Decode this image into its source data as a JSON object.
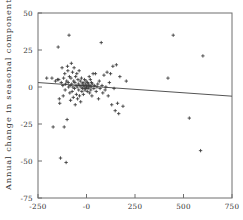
{
  "chart_data": {
    "type": "scatter",
    "title": "",
    "xlabel": "",
    "ylabel": "Annual change in seasonal component",
    "xlim": [
      -250,
      750
    ],
    "ylim": [
      -75,
      50
    ],
    "xticks": [
      -250,
      0,
      250,
      500,
      750
    ],
    "xticklabels": [
      "-250",
      "-0",
      "250",
      "500",
      "750"
    ],
    "yticks": [
      50,
      25,
      0,
      -25,
      -50,
      -75
    ],
    "yticklabels": [
      "50",
      "25",
      "0",
      "-25",
      "-50",
      "-75"
    ],
    "grid": false,
    "legend": null,
    "marker": "plus",
    "marker_color": "#3a3a3a",
    "frame_color": "#6e6e6e",
    "background": "#ffffff",
    "trendline": {
      "type": "line",
      "color": "#555555",
      "x": [
        -250,
        750
      ],
      "y": [
        3.0,
        -6.2
      ]
    },
    "points": [
      {
        "x": -205,
        "y": 6
      },
      {
        "x": -178,
        "y": 6
      },
      {
        "x": -172,
        "y": -27
      },
      {
        "x": -160,
        "y": 4
      },
      {
        "x": -150,
        "y": 5
      },
      {
        "x": -146,
        "y": 27
      },
      {
        "x": -143,
        "y": 5
      },
      {
        "x": -140,
        "y": -8
      },
      {
        "x": -138,
        "y": -11
      },
      {
        "x": -134,
        "y": -48
      },
      {
        "x": -130,
        "y": 3
      },
      {
        "x": -126,
        "y": 13
      },
      {
        "x": -122,
        "y": 1
      },
      {
        "x": -120,
        "y": -6
      },
      {
        "x": -118,
        "y": 6
      },
      {
        "x": -115,
        "y": -27
      },
      {
        "x": -112,
        "y": 9
      },
      {
        "x": -110,
        "y": -2
      },
      {
        "x": -108,
        "y": 2
      },
      {
        "x": -105,
        "y": -51
      },
      {
        "x": -102,
        "y": 4
      },
      {
        "x": -100,
        "y": -22
      },
      {
        "x": -98,
        "y": 14
      },
      {
        "x": -96,
        "y": 11
      },
      {
        "x": -94,
        "y": 3
      },
      {
        "x": -92,
        "y": 0
      },
      {
        "x": -90,
        "y": 35
      },
      {
        "x": -88,
        "y": 7
      },
      {
        "x": -86,
        "y": -4
      },
      {
        "x": -84,
        "y": 1
      },
      {
        "x": -82,
        "y": -9
      },
      {
        "x": -80,
        "y": 6
      },
      {
        "x": -78,
        "y": 16
      },
      {
        "x": -76,
        "y": 2
      },
      {
        "x": -74,
        "y": -3
      },
      {
        "x": -72,
        "y": 10
      },
      {
        "x": -70,
        "y": 0
      },
      {
        "x": -68,
        "y": -7
      },
      {
        "x": -66,
        "y": 4
      },
      {
        "x": -64,
        "y": 13
      },
      {
        "x": -62,
        "y": -1
      },
      {
        "x": -60,
        "y": 3
      },
      {
        "x": -58,
        "y": -12
      },
      {
        "x": -56,
        "y": 7
      },
      {
        "x": -54,
        "y": 1
      },
      {
        "x": -52,
        "y": -5
      },
      {
        "x": -50,
        "y": 9
      },
      {
        "x": -48,
        "y": 0
      },
      {
        "x": -46,
        "y": -8
      },
      {
        "x": -44,
        "y": 5
      },
      {
        "x": -42,
        "y": 2
      },
      {
        "x": -40,
        "y": -2
      },
      {
        "x": -38,
        "y": 11
      },
      {
        "x": -36,
        "y": -6
      },
      {
        "x": -34,
        "y": 1
      },
      {
        "x": -32,
        "y": 4
      },
      {
        "x": -30,
        "y": -10
      },
      {
        "x": -28,
        "y": 0
      },
      {
        "x": -26,
        "y": 6
      },
      {
        "x": -24,
        "y": -3
      },
      {
        "x": -22,
        "y": 2
      },
      {
        "x": -20,
        "y": -1
      },
      {
        "x": -18,
        "y": 3
      },
      {
        "x": -16,
        "y": -5
      },
      {
        "x": -14,
        "y": 1
      },
      {
        "x": -12,
        "y": 0
      },
      {
        "x": -10,
        "y": 5
      },
      {
        "x": -8,
        "y": -2
      },
      {
        "x": -6,
        "y": 2
      },
      {
        "x": -4,
        "y": -1
      },
      {
        "x": -2,
        "y": 4
      },
      {
        "x": 0,
        "y": 0
      },
      {
        "x": 2,
        "y": 1
      },
      {
        "x": 4,
        "y": -3
      },
      {
        "x": 6,
        "y": 3
      },
      {
        "x": 8,
        "y": -1
      },
      {
        "x": 10,
        "y": 2
      },
      {
        "x": 12,
        "y": 0
      },
      {
        "x": 14,
        "y": 7
      },
      {
        "x": 16,
        "y": -4
      },
      {
        "x": 18,
        "y": 1
      },
      {
        "x": 20,
        "y": 5
      },
      {
        "x": 22,
        "y": -2
      },
      {
        "x": 24,
        "y": 0
      },
      {
        "x": 26,
        "y": 3
      },
      {
        "x": 28,
        "y": -6
      },
      {
        "x": 30,
        "y": 2
      },
      {
        "x": 34,
        "y": 9
      },
      {
        "x": 38,
        "y": -1
      },
      {
        "x": 42,
        "y": 1
      },
      {
        "x": 46,
        "y": 9
      },
      {
        "x": 50,
        "y": -3
      },
      {
        "x": 54,
        "y": 0
      },
      {
        "x": 58,
        "y": 2
      },
      {
        "x": 62,
        "y": -8
      },
      {
        "x": 66,
        "y": 4
      },
      {
        "x": 70,
        "y": -1
      },
      {
        "x": 76,
        "y": 30
      },
      {
        "x": 80,
        "y": 1
      },
      {
        "x": 84,
        "y": -4
      },
      {
        "x": 90,
        "y": 8
      },
      {
        "x": 96,
        "y": -2
      },
      {
        "x": 100,
        "y": 0
      },
      {
        "x": 106,
        "y": 10
      },
      {
        "x": 112,
        "y": -6
      },
      {
        "x": 118,
        "y": 3
      },
      {
        "x": 124,
        "y": 9
      },
      {
        "x": 130,
        "y": -12
      },
      {
        "x": 136,
        "y": 14
      },
      {
        "x": 142,
        "y": -1
      },
      {
        "x": 148,
        "y": -16
      },
      {
        "x": 154,
        "y": 15
      },
      {
        "x": 160,
        "y": -11
      },
      {
        "x": 166,
        "y": -18
      },
      {
        "x": 172,
        "y": 7
      },
      {
        "x": 188,
        "y": -13
      },
      {
        "x": 205,
        "y": 4
      },
      {
        "x": 420,
        "y": 6
      },
      {
        "x": 447,
        "y": 35
      },
      {
        "x": 530,
        "y": -21
      },
      {
        "x": 600,
        "y": 21
      },
      {
        "x": 588,
        "y": -43
      }
    ]
  }
}
